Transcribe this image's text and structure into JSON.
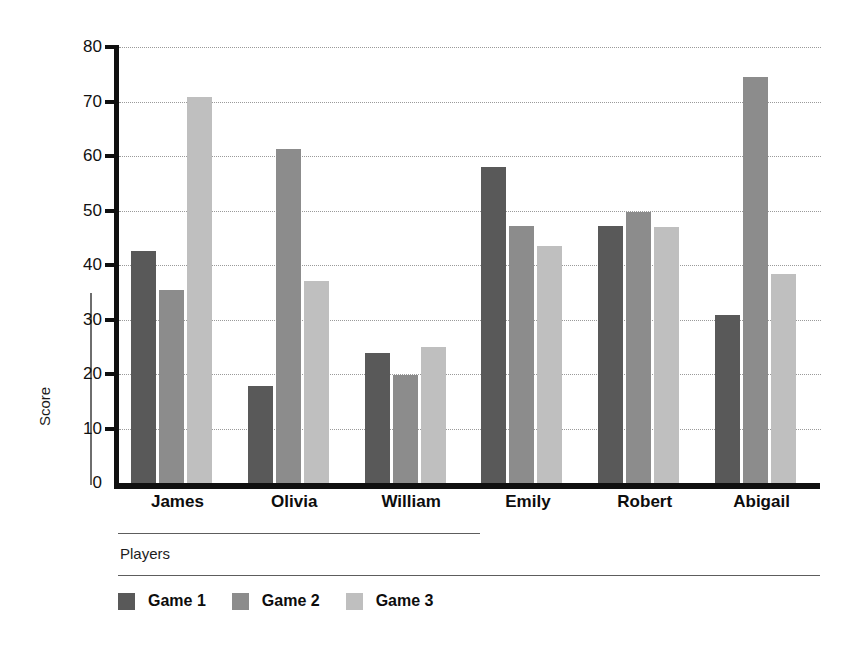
{
  "chart_data": {
    "type": "bar",
    "title": "",
    "xlabel": "Players",
    "ylabel": "Score",
    "categories": [
      "James",
      "Olivia",
      "William",
      "Emily",
      "Robert",
      "Abigail"
    ],
    "series": [
      {
        "name": "Game 1",
        "color": "#595959",
        "values": [
          42.5,
          17.8,
          23.8,
          58.0,
          47.2,
          30.8
        ]
      },
      {
        "name": "Game 2",
        "color": "#8c8c8c",
        "values": [
          35.5,
          61.3,
          19.8,
          47.2,
          49.8,
          74.5
        ]
      },
      {
        "name": "Game 3",
        "color": "#bfbfbf",
        "values": [
          70.8,
          37.0,
          25.0,
          43.5,
          47.0,
          38.3
        ]
      }
    ],
    "ylim": [
      0,
      80
    ],
    "yticks": [
      0,
      10,
      20,
      30,
      40,
      50,
      60,
      70,
      80
    ],
    "ytick_labels": [
      "0",
      "10",
      "20",
      "30",
      "40",
      "50",
      "60",
      "70",
      "80"
    ],
    "grid": true,
    "grid_style": "dotted",
    "legend_position": "bottom-left",
    "axis_color": "#101010",
    "grid_color": "#9a9a9a",
    "background": "#ffffff"
  }
}
